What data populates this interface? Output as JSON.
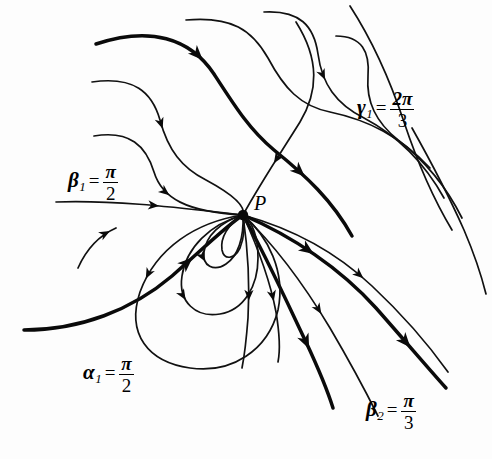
{
  "figure": {
    "type": "phase-portrait",
    "background_color": "#fdfdfd",
    "ink_color": "#0a0a0a",
    "width": 492,
    "height": 459
  },
  "singular_point": {
    "label": "P",
    "x": 243,
    "y": 215
  },
  "labels": [
    {
      "id": "beta1",
      "symbol": "β",
      "subscript": "1",
      "equals": "=",
      "numerator": "π",
      "denominator": "2",
      "value_text": "β₁ = π/2",
      "x": 68,
      "y": 163
    },
    {
      "id": "gamma1",
      "symbol": "γ",
      "subscript": "1",
      "equals": "=",
      "numerator": "2π",
      "denominator": "3",
      "value_text": "γ₁ = 2π/3",
      "x": 357,
      "y": 90
    },
    {
      "id": "alpha1",
      "symbol": "α",
      "subscript": "1",
      "equals": "=",
      "numerator": "π",
      "denominator": "2",
      "value_text": "α₁ = π/2",
      "x": 83,
      "y": 355
    },
    {
      "id": "beta2",
      "symbol": "β",
      "subscript": "2",
      "equals": "=",
      "numerator": "π",
      "denominator": "3",
      "value_text": "β₂ = π/3",
      "x": 366,
      "y": 392
    }
  ],
  "chart_data": {
    "type": "line",
    "title": "",
    "xlabel": "",
    "ylabel": "",
    "legend": [],
    "grid": false,
    "node": {
      "name": "P",
      "x": 243,
      "y": 215
    },
    "series": [
      {
        "name": "upper-thin-1",
        "weight": "thin",
        "path": "M 186 20 C 232 16 252 30 268 58 C 284 88 300 106 330 112 C 368 120 400 136 430 168",
        "arrows": []
      },
      {
        "name": "upper-thick-1",
        "weight": "thick",
        "path": "M 96 44 C 150 26 190 38 214 74 C 236 108 250 130 274 150 C 306 176 332 200 352 236",
        "arrows": [
          {
            "t": 0.33,
            "angle": 30
          },
          {
            "t": 0.78,
            "angle": 52
          }
        ]
      },
      {
        "name": "upper-thin-2",
        "weight": "thin",
        "path": "M 264 12 C 300 10 314 26 318 54 C 322 84 336 104 364 118 C 398 136 424 162 444 198",
        "arrows": [
          {
            "t": 0.38,
            "angle": 48
          }
        ]
      },
      {
        "name": "upper-thin-3",
        "weight": "thin",
        "path": "M 92 82 C 134 76 152 92 160 120 C 168 150 182 168 206 180 C 232 194 246 206 243 215",
        "arrows": [
          {
            "t": 0.44,
            "angle": 50
          }
        ]
      },
      {
        "name": "upper-thin-4",
        "weight": "thin",
        "path": "M 336 36 C 362 36 370 52 368 76 C 366 102 376 122 398 140 C 424 160 446 186 462 218",
        "arrows": []
      },
      {
        "name": "into-P-ne",
        "weight": "thin",
        "path": "M 296 22 C 320 60 318 92 300 122 C 280 154 260 184 243 215",
        "arrows": [
          {
            "t": 0.72,
            "angle": 62
          }
        ]
      },
      {
        "name": "into-P-n",
        "weight": "thin",
        "path": "M 94 136 C 130 130 146 146 154 172 C 162 198 186 212 243 215",
        "arrows": [
          {
            "t": 0.58,
            "angle": 24
          }
        ]
      },
      {
        "name": "into-P-nw",
        "weight": "thin",
        "path": "M 56 202 C 120 200 180 208 243 215",
        "arrows": [
          {
            "t": 0.55,
            "angle": 4
          }
        ]
      },
      {
        "name": "right-thin-1",
        "weight": "thin",
        "path": "M 243 215 C 290 228 336 252 372 286 C 404 316 428 344 448 372",
        "arrows": [
          {
            "t": 0.52,
            "angle": 40
          }
        ]
      },
      {
        "name": "right-thick-1",
        "weight": "thick",
        "path": "M 243 215 C 292 236 340 268 376 308 C 406 342 428 368 446 388",
        "arrows": [
          {
            "t": 0.3,
            "angle": 38
          },
          {
            "t": 0.8,
            "angle": 48
          }
        ]
      },
      {
        "name": "right-thin-2",
        "weight": "thin",
        "path": "M 243 215 C 278 248 306 288 330 328 C 350 362 366 392 378 416",
        "arrows": [
          {
            "t": 0.52,
            "angle": 58
          }
        ]
      },
      {
        "name": "right-thick-2",
        "weight": "thick",
        "path": "M 243 215 C 266 256 286 300 306 342 C 320 372 328 392 333 408",
        "arrows": [
          {
            "t": 0.7,
            "angle": 72
          }
        ]
      },
      {
        "name": "outer-thin-r1",
        "weight": "thin",
        "path": "M 350 6 C 372 40 390 80 404 122 C 418 164 434 200 452 230",
        "arrows": []
      },
      {
        "name": "outer-thin-r2",
        "weight": "thin",
        "path": "M 412 128 C 430 160 448 194 464 230 C 476 258 482 278 486 294",
        "arrows": []
      },
      {
        "name": "left-thick-in",
        "weight": "thick",
        "path": "M 24 330 C 80 330 132 310 172 276 C 204 248 226 226 243 215",
        "arrows": [
          {
            "t": 0.74,
            "angle": -38
          }
        ]
      },
      {
        "name": "left-short",
        "weight": "thin",
        "path": "M 78 268 C 86 250 98 236 116 228",
        "arrows": [
          {
            "t": 0.88,
            "angle": -52
          }
        ]
      },
      {
        "name": "loop-big",
        "weight": "thin",
        "path": "M 243 215 C 196 222 156 248 140 292 C 126 334 148 362 190 368 C 232 374 268 350 278 310 C 286 272 268 236 243 215",
        "arrows": [
          {
            "t": 0.26,
            "angle": 104
          }
        ]
      },
      {
        "name": "loop-mid",
        "weight": "thin",
        "path": "M 243 215 C 210 224 186 248 182 276 C 178 302 196 318 220 314 C 244 310 258 286 258 258 C 258 236 252 222 243 215",
        "arrows": [
          {
            "t": 0.42,
            "angle": 172
          }
        ]
      },
      {
        "name": "loop-small",
        "weight": "thin",
        "path": "M 243 215 C 220 222 206 236 204 252 C 202 266 214 272 226 264 C 238 256 244 238 243 215",
        "arrows": [
          {
            "t": 0.46,
            "angle": 186
          }
        ]
      },
      {
        "name": "loop-inner",
        "weight": "thin",
        "path": "M 243 215 C 228 224 220 238 222 250 C 224 260 234 260 240 248 C 244 238 245 226 243 215",
        "arrows": []
      },
      {
        "name": "down-thin-1",
        "weight": "thin",
        "path": "M 243 215 C 248 250 250 284 248 318 C 246 344 244 358 242 368",
        "arrows": [
          {
            "t": 0.56,
            "angle": 96
          }
        ]
      },
      {
        "name": "down-thin-2",
        "weight": "thin",
        "path": "M 243 215 C 258 248 270 280 276 312 C 280 336 280 352 278 362",
        "arrows": [
          {
            "t": 0.6,
            "angle": 82
          }
        ]
      }
    ]
  }
}
